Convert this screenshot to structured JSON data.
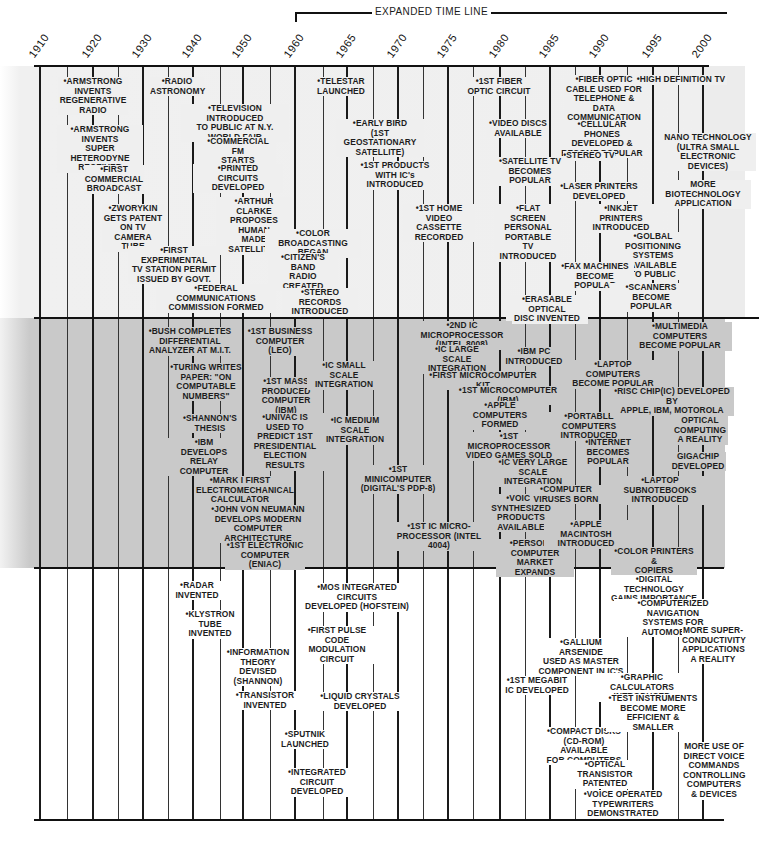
{
  "header": {
    "expanded_label": "EXPANDED TIME LINE"
  },
  "years": [
    {
      "label": "1910",
      "x": 40
    },
    {
      "label": "1920",
      "x": 93
    },
    {
      "label": "1930",
      "x": 143
    },
    {
      "label": "1940",
      "x": 193
    },
    {
      "label": "1950",
      "x": 243
    },
    {
      "label": "1960",
      "x": 295
    },
    {
      "label": "1965",
      "x": 347
    },
    {
      "label": "1970",
      "x": 398
    },
    {
      "label": "1975",
      "x": 448
    },
    {
      "label": "1980",
      "x": 500
    },
    {
      "label": "1985",
      "x": 550
    },
    {
      "label": "1990",
      "x": 600
    },
    {
      "label": "1995",
      "x": 653
    },
    {
      "label": "2000",
      "x": 703
    }
  ],
  "minor_lines": [
    67,
    118,
    168,
    220,
    270,
    323,
    373,
    423,
    473,
    525,
    575,
    627,
    678
  ],
  "bands": {
    "top": {
      "label": "Communications",
      "color": "#efefef"
    },
    "mid": {
      "label": "Computing",
      "color": "#c9c9c9"
    },
    "bot": {
      "label": "Electronics",
      "color": "#ffffff"
    }
  },
  "events_top": [
    {
      "text": "•ARMSTRONG\nINVENTS\nREGENERATIVE\nRADIO",
      "x": 58,
      "y": 77,
      "w": 70
    },
    {
      "text": "•ARMSTRONG\nINVENTS\nSUPER HETERODYNE\nRECEIVER",
      "x": 57,
      "y": 125,
      "w": 86
    },
    {
      "text": "•FIRST\nCOMMERCIAL\nBROADCAST",
      "x": 84,
      "y": 165,
      "w": 60
    },
    {
      "text": "•ZWORYKIN\nGETS PATENT\nON TV\nCAMERA TUBE",
      "x": 102,
      "y": 204,
      "w": 62
    },
    {
      "text": "•FIRST EXPERIMENTAL\nTV STATION PERMIT\nISSUED BY GOVT.",
      "x": 128,
      "y": 246,
      "w": 92
    },
    {
      "text": "•FEDERAL COMMUNICATIONS\nCOMMISSION FORMED",
      "x": 156,
      "y": 284,
      "w": 120
    },
    {
      "text": "•RADIO\nASTRONOMY",
      "x": 150,
      "y": 77,
      "w": 54
    },
    {
      "text": "•TELEVISION INTRODUCED\nTO PUBLIC AT N.Y.\nWORLD FAIR",
      "x": 181,
      "y": 104,
      "w": 108
    },
    {
      "text": "•COMMERCIAL FM\nSTARTS",
      "x": 200,
      "y": 137,
      "w": 76
    },
    {
      "text": "•PRINTED\nCIRCUITS DEVELOPED",
      "x": 193,
      "y": 164,
      "w": 90
    },
    {
      "text": "•ARTHUR CLARKE\nPROPOSES HUMAN\nMADE SATELLITES",
      "x": 216,
      "y": 197,
      "w": 76
    },
    {
      "text": "•COLOR BROADCASTING\nBEGAN",
      "x": 265,
      "y": 229,
      "w": 96
    },
    {
      "text": "•CITIZEN'S\nBAND\nRADIO CREATED",
      "x": 268,
      "y": 253,
      "w": 70
    },
    {
      "text": "•STEREO RECORDS\nINTRODUCED",
      "x": 282,
      "y": 288,
      "w": 76
    },
    {
      "text": "•TELESTAR\nLAUNCHED",
      "x": 314,
      "y": 77,
      "w": 54
    },
    {
      "text": "•EARLY BIRD\n(1ST GEOSTATIONARY\nSATELLITE)",
      "x": 336,
      "y": 119,
      "w": 88
    },
    {
      "text": "•1ST PRODUCTS\nWITH IC's\nINTRODUCED",
      "x": 360,
      "y": 161,
      "w": 70
    },
    {
      "text": "•1ST HOME\nVIDEO CASSETTE\nRECORDED",
      "x": 403,
      "y": 204,
      "w": 72
    },
    {
      "text": "•1ST FIBER\nOPTIC CIRCUIT",
      "x": 466,
      "y": 77,
      "w": 66
    },
    {
      "text": "•VIDEO DISCS\nAVAILABLE",
      "x": 487,
      "y": 119,
      "w": 62
    },
    {
      "text": "•SATELLITE TV\nBECOMES POPULAR",
      "x": 490,
      "y": 157,
      "w": 80
    },
    {
      "text": "•FLAT\nSCREEN\nPERSONAL\nPORTABLE\nTV INTRODUCED",
      "x": 495,
      "y": 204,
      "w": 66
    },
    {
      "text": "•ERASABLE OPTICAL\nDISC INVENTED",
      "x": 506,
      "y": 295,
      "w": 82
    },
    {
      "text": "•FIBER OPTIC\nCABLE USED FOR\nTELEPHONE & DATA\nCOMMUNICATION",
      "x": 564,
      "y": 75,
      "w": 80
    },
    {
      "text": "•CELLULAR PHONES\nDEVELOPED &\nBECOME POPULAR",
      "x": 560,
      "y": 120,
      "w": 84
    },
    {
      "text": "•STEREO TV",
      "x": 563,
      "y": 151,
      "w": 52
    },
    {
      "text": "•LASER PRINTERS\nDEVELOPED",
      "x": 560,
      "y": 182,
      "w": 78
    },
    {
      "text": "•INKJET PRINTERS\nINTRODUCED",
      "x": 582,
      "y": 204,
      "w": 78
    },
    {
      "text": "•GOLBAL POSITIONING\nSYSTEMS AVAILABLE\nTO PUBLIC",
      "x": 608,
      "y": 232,
      "w": 90
    },
    {
      "text": "•FAX MACHINES\nBECOME POPULAR",
      "x": 556,
      "y": 262,
      "w": 78
    },
    {
      "text": "•SCANNERS BECOME\nPOPULAR",
      "x": 610,
      "y": 283,
      "w": 82
    },
    {
      "text": "•HIGH DEFINITION TV",
      "x": 635,
      "y": 75,
      "w": 92
    },
    {
      "text": "NANO TECHNOLOGY\n(ULTRA SMALL\nELECTRONIC DEVICES)",
      "x": 660,
      "y": 133,
      "w": 96
    },
    {
      "text": "MORE BIOTECHNOLOGY\nAPPLICATION",
      "x": 655,
      "y": 180,
      "w": 96
    }
  ],
  "events_mid": [
    {
      "text": "•BUSH COMPLETES\nDIFFERENTIAL\nANALYZER AT M.I.T.",
      "x": 148,
      "y": 327,
      "w": 84
    },
    {
      "text": "•TURING WRITES\nPAPER: \"ON\nCOMPUTABLE\nNUMBERS\"",
      "x": 170,
      "y": 363,
      "w": 72
    },
    {
      "text": "•SHANNON'S\nTHESIS",
      "x": 182,
      "y": 414,
      "w": 56
    },
    {
      "text": "•IBM\nDEVELOPS\nRELAY COMPUTER",
      "x": 166,
      "y": 438,
      "w": 76
    },
    {
      "text": "•MARK I FIRST\nELECTROMECHANICAL\nCALCULATOR",
      "x": 196,
      "y": 476,
      "w": 88
    },
    {
      "text": "•JOHN VON NEUMANN\nDEVELOPS MODERN\nCOMPUTER ARCHITECTURE",
      "x": 206,
      "y": 505,
      "w": 104
    },
    {
      "text": "•1ST ELECTRONIC\nCOMPUTER (ENIAC)",
      "x": 225,
      "y": 541,
      "w": 80
    },
    {
      "text": "•1ST BUSINESS\nCOMPUTER (LEO)",
      "x": 246,
      "y": 327,
      "w": 68
    },
    {
      "text": "•1ST MASS\nPRODUCED\nCOMPUTER (IBM)",
      "x": 250,
      "y": 377,
      "w": 72
    },
    {
      "text": "•UNIVAC IS\nUSED TO\nPREDICT 1ST\nPRESIDENTIAL\nELECTION RESULTS",
      "x": 245,
      "y": 413,
      "w": 80
    },
    {
      "text": "•IC SMALL SCALE\nINTEGRATION",
      "x": 307,
      "y": 361,
      "w": 74
    },
    {
      "text": "•IC MEDIUM\nSCALE INTEGRATION",
      "x": 315,
      "y": 416,
      "w": 80
    },
    {
      "text": "•1ST MINICOMPUTER\n(DIGITAL'S PDP-8)",
      "x": 357,
      "y": 465,
      "w": 82
    },
    {
      "text": "•1ST IC MICRO-\nPROCESSOR (INTEL 4004)",
      "x": 389,
      "y": 522,
      "w": 100
    },
    {
      "text": "•2ND IC MICROPROCESSOR\n(INTEL 8008)",
      "x": 412,
      "y": 321,
      "w": 100
    },
    {
      "text": "•IC LARGE SCALE\nINTEGRATION",
      "x": 420,
      "y": 345,
      "w": 74
    },
    {
      "text": "•FIRST MICROCOMPUTER KIT",
      "x": 425,
      "y": 371,
      "w": 116
    },
    {
      "text": "•1ST MICROCOMPUTER (IBM)",
      "x": 451,
      "y": 386,
      "w": 114
    },
    {
      "text": "•APPLE COMPUTERS\nFORMED",
      "x": 460,
      "y": 401,
      "w": 80
    },
    {
      "text": "•1ST MICROPROCESSOR\nVIDEO GAMES SOLD",
      "x": 462,
      "y": 432,
      "w": 94
    },
    {
      "text": "•IC VERY LARGE\nSCALE\nINTEGRATION",
      "x": 497,
      "y": 458,
      "w": 72
    },
    {
      "text": "•VOICE\nSYNTHESIZED\nPRODUCTS\nAVAILABLE",
      "x": 490,
      "y": 494,
      "w": 62
    },
    {
      "text": "•PERSONAL\nCOMPUTER\nMARKET EXPANDS",
      "x": 496,
      "y": 539,
      "w": 78
    },
    {
      "text": "•IBM PC\nINTRODUCED",
      "x": 505,
      "y": 347,
      "w": 58
    },
    {
      "text": "•PORTABLE COMPUTERS\nINTRODUCED",
      "x": 541,
      "y": 412,
      "w": 96
    },
    {
      "text": "•COMPUTER\nVIRUSES BORN",
      "x": 530,
      "y": 485,
      "w": 72
    },
    {
      "text": "•APPLE MACINTOSH\nINTRODUCED",
      "x": 544,
      "y": 520,
      "w": 84
    },
    {
      "text": "•LAPTOP COMPUTERS\nBECOME POPULAR",
      "x": 570,
      "y": 360,
      "w": 86
    },
    {
      "text": "•INTERNET\nBECOMES\nPOPULAR",
      "x": 580,
      "y": 438,
      "w": 56
    },
    {
      "text": "•MULTIMEDIA COMPUTERS\nBECOME POPULAR",
      "x": 628,
      "y": 322,
      "w": 104
    },
    {
      "text": "•RISC CHIP(IC) DEVELOPED BY\nAPPLE, IBM, MOTOROLA",
      "x": 610,
      "y": 387,
      "w": 124
    },
    {
      "text": "OPTICAL\nCOMPUTING\nA REALITY",
      "x": 672,
      "y": 416,
      "w": 56
    },
    {
      "text": "GIGACHIP\nDEVELOPED",
      "x": 670,
      "y": 452,
      "w": 56
    },
    {
      "text": "•LAPTOP SUBNOTEBOOKS\nINTRODUCED",
      "x": 608,
      "y": 476,
      "w": 104
    },
    {
      "text": "•COLOR PRINTERS &\nCOPIERS AVAILABLE",
      "x": 611,
      "y": 547,
      "w": 86
    }
  ],
  "events_bot": [
    {
      "text": "•RADAR\nINVENTED",
      "x": 172,
      "y": 581,
      "w": 50
    },
    {
      "text": "•KLYSTRON\nTUBE\nINVENTED",
      "x": 182,
      "y": 610,
      "w": 56
    },
    {
      "text": "•INFORMATION\nTHEORY DEVISED\n(SHANNON)",
      "x": 222,
      "y": 648,
      "w": 72
    },
    {
      "text": "•TRANSISTOR\nINVENTED",
      "x": 234,
      "y": 691,
      "w": 62
    },
    {
      "text": "•SPUTNIK\nLAUNCHED",
      "x": 278,
      "y": 730,
      "w": 54
    },
    {
      "text": "•INTEGRATED\nCIRCUIT\nDEVELOPED",
      "x": 286,
      "y": 768,
      "w": 62
    },
    {
      "text": "•MOS INTEGRATED CIRCUITS\nDEVELOPED (HOFSTEIN)",
      "x": 300,
      "y": 583,
      "w": 114
    },
    {
      "text": "•FIRST PULSE\nCODE MODULATION\nCIRCUIT",
      "x": 298,
      "y": 626,
      "w": 78
    },
    {
      "text": "•LIQUID CRYSTALS\nDEVELOPED",
      "x": 320,
      "y": 692,
      "w": 80
    },
    {
      "text": "•1ST MEGABIT\nIC DEVELOPED",
      "x": 505,
      "y": 676,
      "w": 64
    },
    {
      "text": "•GALLIUM ARSENIDE\nUSED AS MASTER\nCOMPONENT IN IC'S",
      "x": 538,
      "y": 638,
      "w": 86
    },
    {
      "text": "•COMPACT DISKS\n(CD-ROM) AVAILABLE\nFOR COMPUTERS",
      "x": 541,
      "y": 727,
      "w": 86
    },
    {
      "text": "•OPTICAL TRANSISTOR\nPATENTED",
      "x": 558,
      "y": 760,
      "w": 94
    },
    {
      "text": "•VOICE OPERATED\nTYPEWRITERS\nDEMONSTRATED",
      "x": 583,
      "y": 790,
      "w": 80
    },
    {
      "text": "•DIGITAL TECHNOLOGY\nGAINS IMPORTANCE",
      "x": 608,
      "y": 575,
      "w": 92
    },
    {
      "text": "•COMPUTERIZED NAVIGATION\nSYSTEMS FOR AUTOMOBILES",
      "x": 614,
      "y": 599,
      "w": 118
    },
    {
      "text": "MORE SUPER-\nCONDUCTIVITY\nAPPLICATIONS\nA REALITY",
      "x": 682,
      "y": 626,
      "w": 62
    },
    {
      "text": "•GRAPHIC CALCULATORS\nINTRODUCED",
      "x": 592,
      "y": 673,
      "w": 100
    },
    {
      "text": "•TEST INSTRUMENTS\nBECOME MORE\nEFFICIENT & SMALLER",
      "x": 606,
      "y": 694,
      "w": 94
    },
    {
      "text": "MORE USE OF\nDIRECT VOICE\nCOMMANDS\nCONTROLLING\nCOMPUTERS\n& DEVICES",
      "x": 683,
      "y": 742,
      "w": 62
    }
  ]
}
